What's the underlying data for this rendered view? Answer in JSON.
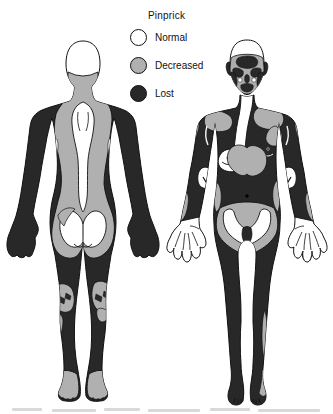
{
  "figure": {
    "type": "medical-sensory-body-map",
    "modality": "Pinprick",
    "views": [
      "posterior",
      "anterior"
    ]
  },
  "legend": {
    "title": "Pinprick",
    "items": [
      {
        "label": "Normal",
        "color": "#ffffff"
      },
      {
        "label": "Decreased",
        "color": "#b0b0b0"
      },
      {
        "label": "Lost",
        "color": "#282828"
      }
    ]
  },
  "body_regions": {
    "posterior": [
      {
        "region": "scalp",
        "status": "Normal"
      },
      {
        "region": "neck and trapezius",
        "status": "Decreased"
      },
      {
        "region": "midline spine strip",
        "status": "Normal"
      },
      {
        "region": "central back",
        "status": "Decreased"
      },
      {
        "region": "shoulders, arms, hands",
        "status": "Lost"
      },
      {
        "region": "triceps stripe marks",
        "status": "Normal"
      },
      {
        "region": "flanks",
        "status": "Lost"
      },
      {
        "region": "buttocks",
        "status": "Normal"
      },
      {
        "region": "around buttocks / sacrum",
        "status": "Decreased"
      },
      {
        "region": "legs",
        "status": "Lost"
      },
      {
        "region": "popliteal fossae",
        "status": "Decreased"
      },
      {
        "region": "feet",
        "status": "Decreased"
      }
    ],
    "anterior": [
      {
        "region": "scalp / hair",
        "status": "Normal"
      },
      {
        "region": "face",
        "status": "Decreased with Lost patches"
      },
      {
        "region": "throat / sternum",
        "status": "Normal"
      },
      {
        "region": "right chest and nipple",
        "status": "Normal"
      },
      {
        "region": "clavicular patches",
        "status": "Decreased"
      },
      {
        "region": "central lower chest",
        "status": "Decreased"
      },
      {
        "region": "trunk and abdomen",
        "status": "Lost"
      },
      {
        "region": "antecubital fossae",
        "status": "Normal"
      },
      {
        "region": "inguinal crescent",
        "status": "Normal"
      },
      {
        "region": "pelvic band",
        "status": "Decreased"
      },
      {
        "region": "genitals",
        "status": "Lost"
      },
      {
        "region": "hands",
        "status": "Normal"
      },
      {
        "region": "legs and feet",
        "status": "Lost"
      },
      {
        "region": "left lateral shin strip",
        "status": "Decreased"
      },
      {
        "region": "left foot lateral edge",
        "status": "Decreased"
      }
    ]
  },
  "colors": {
    "normal": "#ffffff",
    "decreased": "#b0b0b0",
    "lost": "#282828",
    "outline": "#111111",
    "background": "#ffffff"
  }
}
